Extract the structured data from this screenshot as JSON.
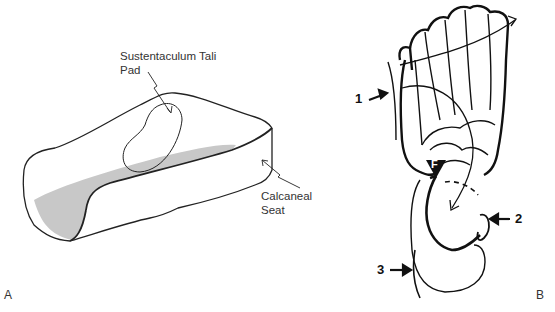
{
  "figure": {
    "panel_a": {
      "panel_label": "A",
      "labels": {
        "sustentaculum_line1": "Sustentaculum Tali",
        "sustentaculum_line2": "Pad",
        "calcaneal_line1": "Calcaneal",
        "calcaneal_line2": "Seat"
      }
    },
    "panel_b": {
      "panel_label": "B",
      "markers": [
        "1",
        "2",
        "3"
      ],
      "force_marker": "F"
    }
  }
}
